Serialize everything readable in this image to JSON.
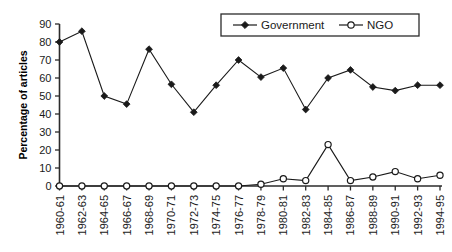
{
  "chart_data": {
    "type": "line",
    "title": "",
    "xlabel": "",
    "ylabel": "Percentage of articles",
    "ylim": [
      0,
      90
    ],
    "yticks": [
      0,
      10,
      20,
      30,
      40,
      50,
      60,
      70,
      80,
      90
    ],
    "grid": false,
    "legend_position": "top-right",
    "categories": [
      "1960-61",
      "1962-63",
      "1964-65",
      "1966-67",
      "1968-69",
      "1970-71",
      "1972-73",
      "1974-75",
      "1976-77",
      "1978-79",
      "1980-81",
      "1982-83",
      "1984-85",
      "1986-87",
      "1988-89",
      "1990-91",
      "1992-93",
      "1994-95"
    ],
    "series": [
      {
        "name": "Government",
        "marker": "filled-diamond",
        "color": "#1a1a1a",
        "values": [
          80,
          86,
          50,
          45.5,
          76,
          56.5,
          41,
          56,
          70,
          60.5,
          65.5,
          42.5,
          60,
          64.5,
          55,
          53,
          56,
          56
        ]
      },
      {
        "name": "NGO",
        "marker": "open-circle",
        "color": "#1a1a1a",
        "values": [
          0,
          0,
          0,
          0,
          0,
          0,
          0,
          0,
          0,
          1,
          4,
          3,
          23,
          3,
          5,
          8,
          4,
          6
        ]
      }
    ]
  },
  "legend": {
    "items": [
      {
        "label": "Government",
        "marker": "filled-diamond"
      },
      {
        "label": "NGO",
        "marker": "open-circle"
      }
    ]
  },
  "axes": {
    "y_title": "Percentage of articles"
  }
}
